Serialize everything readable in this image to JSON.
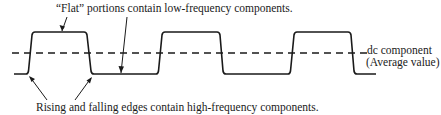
{
  "annotations": {
    "top": "“Flat” portions contain low-frequency components.",
    "bottom": "Rising and falling edges contain high-frequency components.",
    "dc_line1": "dc component",
    "dc_line2": "(Average value)"
  },
  "waveform": {
    "type": "periodic rectangular pulse train with finite rise/fall times",
    "high_level_y": 32,
    "low_level_y": 74,
    "dc_average_y": 53,
    "pulses": 3
  },
  "colors": {
    "line": "#1a1a1a",
    "background": "#ffffff"
  }
}
